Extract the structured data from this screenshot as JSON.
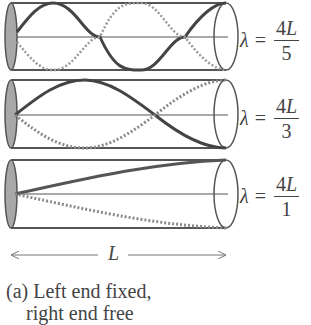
{
  "figure": {
    "tubes": [
      {
        "id": "tube-1",
        "harmonic": 5,
        "formula": {
          "symbol": "λ",
          "equals": "=",
          "numerator_coef": "4",
          "numerator_var": "L",
          "denominator": "5"
        }
      },
      {
        "id": "tube-2",
        "harmonic": 3,
        "formula": {
          "symbol": "λ",
          "equals": "=",
          "numerator_coef": "4",
          "numerator_var": "L",
          "denominator": "3"
        }
      },
      {
        "id": "tube-3",
        "harmonic": 1,
        "formula": {
          "symbol": "λ",
          "equals": "=",
          "numerator_coef": "4",
          "numerator_var": "L",
          "denominator": "1"
        }
      }
    ],
    "length_label": "L",
    "caption_line1": "(a) Left end fixed,",
    "caption_line2": "right end free"
  },
  "colors": {
    "outline": "#555555",
    "wave": "#444444",
    "dotted": "#9a9a9a",
    "end_cap": "#a8a8a8"
  }
}
